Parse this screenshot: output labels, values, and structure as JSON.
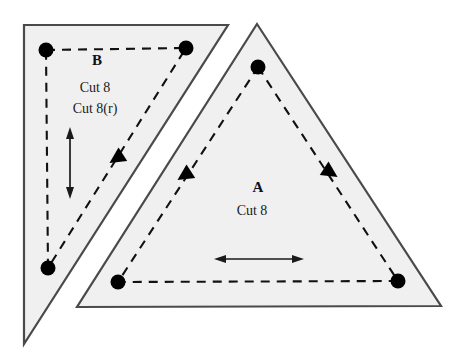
{
  "document": {
    "title": "Quilt Template Pattern Diagram",
    "background_color": "#ffffff"
  },
  "style": {
    "piece_fill": "#f0f0f0",
    "piece_stroke": "#4a4a4a",
    "seam_line_color": "#111111",
    "dot_color": "#000000",
    "grain_arrow_color": "#1a1a1a",
    "text_color": "#111111"
  },
  "pieces": [
    {
      "id": "piece-b",
      "label": "B",
      "cut_lines": [
        "Cut 8",
        "Cut 8(r)"
      ],
      "shape": "right-triangle",
      "outline_points": "24,25 228,25 24,344",
      "seam_points": "46,50 186,48 48,268",
      "dots": [
        {
          "name": "seam-dot-b-top-left",
          "cx": 46,
          "cy": 50,
          "r": 7.5
        },
        {
          "name": "seam-dot-b-top-right",
          "cx": 186,
          "cy": 48,
          "r": 7.5
        },
        {
          "name": "seam-dot-b-bottom-left",
          "cx": 48,
          "cy": 268,
          "r": 7.5
        }
      ],
      "label_position": {
        "x": 97,
        "y": 62
      },
      "cut_label_positions": [
        {
          "x": 95,
          "y": 89
        },
        {
          "x": 95,
          "y": 110
        }
      ],
      "grain_arrow": {
        "name": "grain-arrow-b",
        "direction": "vertical",
        "x1": 70,
        "y1": 131,
        "x2": 70,
        "y2": 195
      },
      "direction_markers": [
        {
          "name": "seam-direction-marker-b",
          "x": 117,
          "y": 158,
          "angle": 237
        }
      ]
    },
    {
      "id": "piece-a",
      "label": "A",
      "cut_lines": [
        "Cut 8"
      ],
      "shape": "isosceles-triangle",
      "outline_points": "257,24 441,306 77,307",
      "seam_points": "258,67 398,281 118,282",
      "dots": [
        {
          "name": "seam-dot-a-apex",
          "cx": 258,
          "cy": 67,
          "r": 7.5
        },
        {
          "name": "seam-dot-a-bottom-right",
          "cx": 398,
          "cy": 281,
          "r": 7.5
        },
        {
          "name": "seam-dot-a-bottom-left",
          "cx": 118,
          "cy": 282,
          "r": 7.5
        }
      ],
      "label_position": {
        "x": 258,
        "y": 189
      },
      "cut_label_positions": [
        {
          "x": 252,
          "y": 212
        }
      ],
      "grain_arrow": {
        "name": "grain-arrow-a",
        "direction": "horizontal",
        "x1": 215,
        "y1": 259,
        "x2": 303,
        "y2": 259
      },
      "direction_markers": [
        {
          "name": "seam-direction-marker-a-left",
          "x": 185,
          "y": 175,
          "angle": 237
        },
        {
          "name": "seam-direction-marker-a-right",
          "x": 330,
          "y": 172,
          "angle": 123
        }
      ]
    }
  ]
}
